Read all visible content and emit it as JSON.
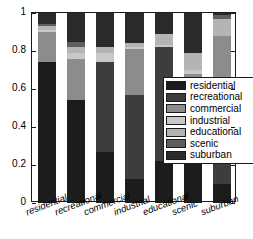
{
  "chart_data": {
    "type": "bar",
    "stacked": true,
    "normalized": true,
    "title": "",
    "xlabel": "",
    "ylabel": "",
    "ylim": [
      0,
      1
    ],
    "ytick_labels": [
      "0",
      "0.2",
      "0.4",
      "0.6",
      "0.8",
      "1"
    ],
    "ytick_values": [
      0,
      0.2,
      0.4,
      0.6,
      0.8,
      1
    ],
    "grid": false,
    "legend_position": "center-right-inside",
    "categories": [
      "residential",
      "recreational",
      "commercial",
      "industrial",
      "educational",
      "scenic",
      "suburban"
    ],
    "series": [
      {
        "name": "residential",
        "color": "#1c1c1c",
        "values": [
          0.74,
          0.54,
          0.27,
          0.125,
          0.22,
          0.21,
          0.1
        ]
      },
      {
        "name": "recreational",
        "color": "#3d3d3d",
        "values": [
          0.0,
          0.0,
          0.47,
          0.445,
          0.6,
          0.0,
          0.5
        ]
      },
      {
        "name": "commercial",
        "color": "#8c8c8c",
        "values": [
          0.16,
          0.22,
          0.0,
          0.24,
          0.0,
          0.47,
          0.28
        ]
      },
      {
        "name": "industrial",
        "color": "#c8c8c8",
        "values": [
          0.01,
          0.03,
          0.05,
          0.01,
          0.01,
          0.02,
          0.0
        ]
      },
      {
        "name": "educational",
        "color": "#b4b4b4",
        "values": [
          0.02,
          0.03,
          0.03,
          0.02,
          0.06,
          0.09,
          0.09
        ]
      },
      {
        "name": "scenic",
        "color": "#5e5e5e",
        "values": [
          0.01,
          0.03,
          0.0,
          0.0,
          0.0,
          0.0,
          0.02
        ]
      },
      {
        "name": "suburban",
        "color": "#2a2a2a",
        "values": [
          0.06,
          0.15,
          0.18,
          0.16,
          0.11,
          0.21,
          0.01
        ]
      }
    ]
  },
  "legend": {
    "items": [
      {
        "label": "residential",
        "color": "#1c1c1c"
      },
      {
        "label": "recreational",
        "color": "#3d3d3d"
      },
      {
        "label": "commercial",
        "color": "#8c8c8c"
      },
      {
        "label": "industrial",
        "color": "#c8c8c8"
      },
      {
        "label": "educational",
        "color": "#b4b4b4"
      },
      {
        "label": "scenic",
        "color": "#5e5e5e"
      },
      {
        "label": "suburban",
        "color": "#2a2a2a"
      }
    ]
  },
  "axes": {
    "border_color": "#1a1a1a",
    "background": "#ffffff"
  }
}
